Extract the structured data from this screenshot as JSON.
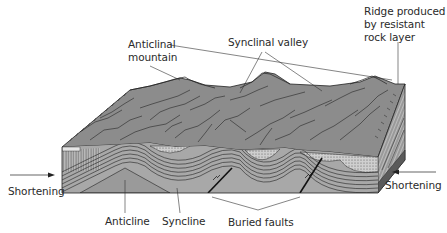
{
  "diagram": {
    "labels": {
      "anticlinal_mountain": [
        "Anticlinal",
        "mountain"
      ],
      "synclinal_valley": "Synclinal valley",
      "ridge": [
        "Ridge produced",
        "by resistant",
        "rock layer"
      ],
      "shortening_left": "Shortening",
      "shortening_right": "Shortening",
      "anticline": "Anticline",
      "syncline": "Syncline",
      "buried_faults": "Buried faults"
    },
    "arrows": {
      "left": {
        "direction": "right"
      },
      "right": {
        "direction": "left"
      }
    },
    "colors": {
      "terrain": "#8a8a8a",
      "terrain_dark": "#6e6e6e",
      "layer_light": "#b3b3b3",
      "layer_mid": "#9c9c9c",
      "stipple": "#c8c8c8",
      "line": "#222222",
      "text": "#2a2a2a"
    }
  }
}
